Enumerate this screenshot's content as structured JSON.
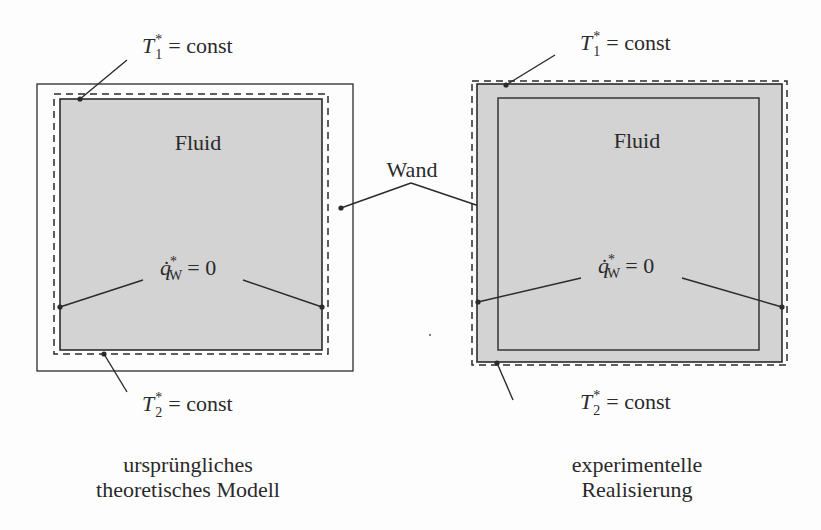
{
  "colors": {
    "fluid_fill": "#d3d3d3",
    "line": "#2b2b2b",
    "background": "#fdfdfd"
  },
  "left_model": {
    "fluid_label": "Fluid",
    "top_bc": {
      "symbol": "T",
      "subscript": "1",
      "superscript": "*",
      "rhs": "= const"
    },
    "bottom_bc": {
      "symbol": "T",
      "subscript": "2",
      "superscript": "*",
      "rhs": "= const"
    },
    "side_bc": {
      "symbol": "q̇",
      "subscript": "W",
      "superscript": "*",
      "rhs": "= 0"
    },
    "caption_line1": "ursprüngliches",
    "caption_line2": "theoretisches Modell"
  },
  "right_model": {
    "fluid_label": "Fluid",
    "top_bc": {
      "symbol": "T",
      "subscript": "1",
      "superscript": "*",
      "rhs": "= const"
    },
    "bottom_bc": {
      "symbol": "T",
      "subscript": "2",
      "superscript": "*",
      "rhs": "= const"
    },
    "side_bc": {
      "symbol": "q̇",
      "subscript": "W",
      "superscript": "*",
      "rhs": "= 0"
    },
    "caption_line1": "experimentelle",
    "caption_line2": "Realisierung"
  },
  "shared": {
    "wall_label": "Wand"
  }
}
